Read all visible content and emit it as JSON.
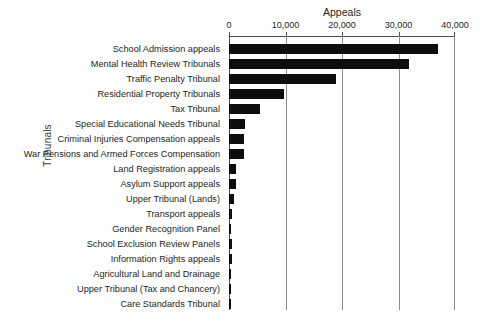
{
  "chart_data": {
    "type": "bar",
    "orientation": "horizontal",
    "title": "",
    "xlabel": "Appeals",
    "ylabel": "Tribunals",
    "xlim": [
      0,
      40000
    ],
    "x_ticks": [
      0,
      10000,
      20000,
      30000,
      40000
    ],
    "x_tick_labels": [
      "0",
      "10,000",
      "20,000",
      "30,000",
      "40,000"
    ],
    "grid": "vertical",
    "legend": "none",
    "bar_color": "#0d0d0d",
    "categories": [
      "School Admission appeals",
      "Mental Health Review Tribunals",
      "Traffic Penalty Tribunal",
      "Residential Property Tribunals",
      "Tax Tribunal",
      "Special Educational Needs Tribunal",
      "Criminal Injuries Compensation appeals",
      "War Pensions and Armed Forces Compensation",
      "Land Registration appeals",
      "Asylum Support appeals",
      "Upper Tribunal (Lands)",
      "Transport appeals",
      "Gender Recognition Panel",
      "School Exclusion Review Panels",
      "Information Rights appeals",
      "Agricultural Land and Drainage",
      "Upper Tribunal (Tax and Chancery)",
      "Care Standards Tribunal"
    ],
    "values": [
      37000,
      31800,
      19000,
      9700,
      5500,
      2800,
      2700,
      2700,
      1250,
      1200,
      800,
      450,
      400,
      450,
      600,
      300,
      400,
      300
    ]
  }
}
